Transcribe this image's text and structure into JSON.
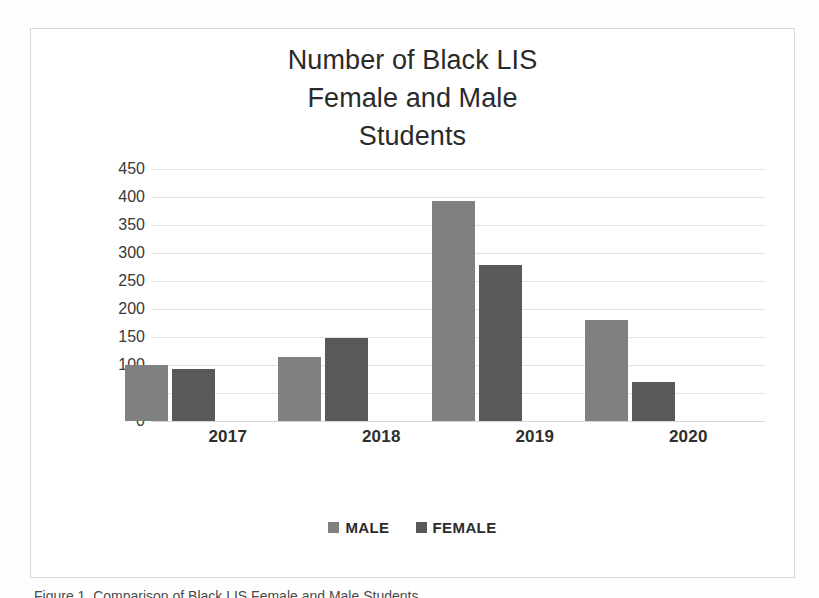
{
  "chart_data": {
    "type": "bar",
    "title": "Number of Black LIS\nFemale and Male\nStudents",
    "categories": [
      "2017",
      "2018",
      "2019",
      "2020"
    ],
    "series": [
      {
        "name": "MALE",
        "color": "#808080",
        "values": [
          100,
          115,
          393,
          180
        ]
      },
      {
        "name": "FEMALE",
        "color": "#595959",
        "values": [
          93,
          148,
          278,
          70
        ]
      }
    ],
    "xlabel": "",
    "ylabel": "",
    "ylim": [
      0,
      450
    ],
    "ytick_step": 50,
    "yticks": [
      450,
      400,
      350,
      300,
      250,
      200,
      150,
      100,
      50,
      0
    ],
    "grid": true,
    "legend_position": "bottom"
  },
  "caption": {
    "clipped_text": "Figure 1. Comparison of Black LIS Female and Male Students"
  }
}
